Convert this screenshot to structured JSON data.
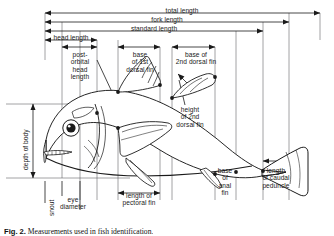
{
  "figure": {
    "caption_prefix": "Fig. 2.",
    "caption_text": "Measurements used in fish identification.",
    "background": "#ffffff",
    "ink_color": "#1a1a1a"
  },
  "measurements": {
    "total_length": "total length",
    "fork_length": "fork length",
    "standard_length": "standard length",
    "head_length": "head length",
    "post_orbital_head_length": "post-\norbital\nhead\nlength",
    "base_of_1st_dorsal_fin": "base\nof 1st\ndorsal fin",
    "base_of_2nd_dorsal_fin": "base of\n2nd dorsal fin",
    "height_of_2nd_dorsal_fin": "height\nof 2nd\ndorsal fin",
    "depth_of_body": "depth of body",
    "snout": "snout",
    "eye_diameter": "eye\ndiameter",
    "length_of_pectoral_fin": "length of\npectoral fin",
    "base_of_anal_fin": "base\nof\nanal\nfin",
    "length_of_caudal_peduncle": "length\nof caudal\npeduncle"
  },
  "anatomy": {
    "fish_outline": "fish-body-outline",
    "eye": "fish-eye",
    "first_dorsal_fin": "first-dorsal-fin",
    "second_dorsal_fin": "second-dorsal-fin",
    "pectoral_fin": "pectoral-fin",
    "pelvic_fin": "pelvic-fin",
    "anal_fin": "anal-fin",
    "caudal_fin": "caudal-fin",
    "caudal_peduncle": "caudal-peduncle"
  }
}
